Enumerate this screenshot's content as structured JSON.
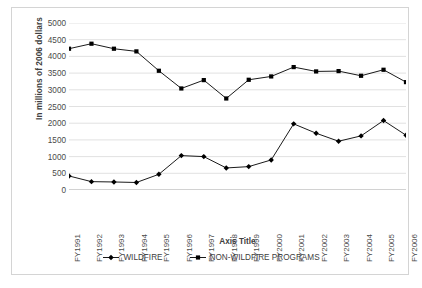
{
  "chart_data": {
    "type": "line",
    "title": "",
    "xlabel": "Axis Title",
    "ylabel": "In millions of 2006 dollars",
    "categories": [
      "FY1991",
      "FY1992",
      "FY1993",
      "FY1994",
      "FY1995",
      "FY1996",
      "FY1997",
      "FY1998",
      "FY1999",
      "FY2000",
      "FY2001",
      "FY2002",
      "FY2003",
      "FY2004",
      "FY2005",
      "FY2006"
    ],
    "ylim": [
      0,
      5000
    ],
    "ytick_values": [
      0,
      500,
      1000,
      1500,
      2000,
      2500,
      3000,
      3500,
      4000,
      4500,
      5000
    ],
    "ytick_labels": [
      "0",
      "500",
      "1000",
      "1500",
      "2000",
      "2500",
      "3000",
      "3500",
      "4000",
      "4500",
      "5000"
    ],
    "grid": true,
    "legend_position": "bottom",
    "series": [
      {
        "name": "WILDFIRE",
        "marker": "diamond",
        "color": "#000000",
        "values": [
          420,
          250,
          240,
          225,
          470,
          1030,
          1000,
          660,
          700,
          900,
          1980,
          1700,
          1460,
          1620,
          2080,
          1640
        ]
      },
      {
        "name": "NON-WILDFIRE PROGRAMS",
        "marker": "square",
        "color": "#000000",
        "values": [
          4230,
          4380,
          4230,
          4150,
          3570,
          3040,
          3290,
          2740,
          3300,
          3400,
          3680,
          3550,
          3560,
          3420,
          3600,
          3230
        ]
      }
    ]
  }
}
